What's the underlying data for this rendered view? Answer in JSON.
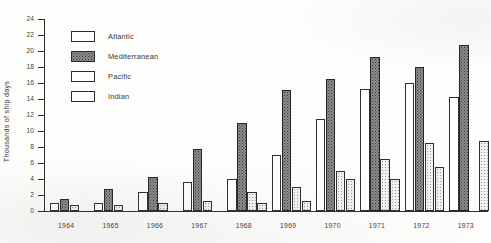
{
  "chart_data": {
    "type": "bar",
    "title": "",
    "subtitle": "",
    "xlabel": "",
    "ylabel": "Thousands of ship days",
    "categories": [
      "1964",
      "1965",
      "1966",
      "1967",
      "1968",
      "1969",
      "1970",
      "1971",
      "1972",
      "1973"
    ],
    "ylim": [
      0,
      24
    ],
    "ytick_step": 2,
    "yticks": [
      0,
      2,
      4,
      6,
      8,
      10,
      12,
      14,
      16,
      18,
      20,
      22,
      24
    ],
    "ytick_labels": [
      "0",
      "2",
      "4",
      "6",
      "8",
      "10",
      "12",
      "14",
      "16",
      "18",
      "20",
      "22",
      "24"
    ],
    "grid": false,
    "legend_position": "upper-left-inside",
    "series": [
      {
        "name": "Atlantic",
        "fill": "plain-white",
        "values": [
          1.0,
          1.0,
          2.4,
          3.6,
          4.0,
          7.0,
          11.5,
          15.3,
          16.0,
          14.3
        ]
      },
      {
        "name": "Mediterranean",
        "fill": "dark-stipple",
        "values": [
          1.5,
          2.7,
          4.3,
          7.8,
          11.0,
          15.1,
          16.5,
          19.3,
          18.0,
          20.7
        ]
      },
      {
        "name": "Pacific",
        "fill": "light-stipple",
        "values": [
          0.7,
          0.8,
          1.0,
          1.3,
          2.4,
          3.0,
          5.0,
          6.5,
          8.5,
          0.0
        ]
      },
      {
        "name": "Indian",
        "fill": "light-stipple",
        "values": [
          0.0,
          0.0,
          0.0,
          0.0,
          1.0,
          1.3,
          4.0,
          4.0,
          5.5,
          8.7
        ]
      }
    ],
    "colors": {
      "axis": "#2b2b2b",
      "text": "#3c3c3c",
      "mediterranean_fill": "#8d8d8d",
      "plain_fill": "#ffffff",
      "light_fill": "#f2f1ef"
    }
  },
  "legend": {
    "items": [
      {
        "label": "Atlantic"
      },
      {
        "label": "Mediterranean"
      },
      {
        "label": "Pacific"
      },
      {
        "label": "Indian"
      }
    ]
  }
}
